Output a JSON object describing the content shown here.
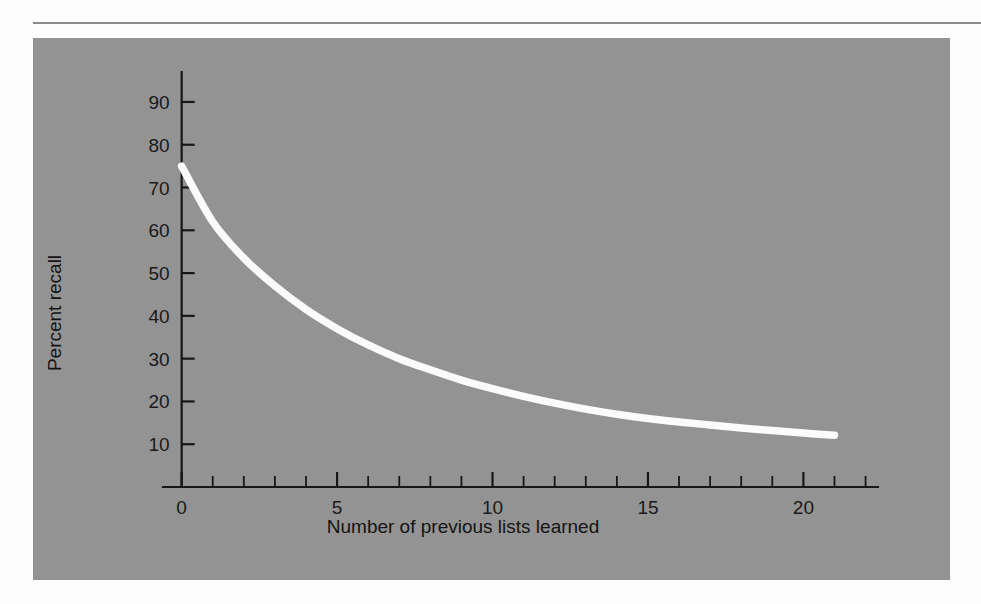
{
  "figure": {
    "background_color": "#fdfdfd",
    "panel_color": "#939393",
    "rule_color": "#8b8b8b",
    "curve_color": "#fbfbfb",
    "axis_color": "#171717"
  },
  "chart_data": {
    "type": "line",
    "title": "",
    "xlabel": "Number of previous lists learned",
    "ylabel": "Percent recall",
    "xlim": [
      -0.6,
      22.4
    ],
    "ylim": [
      0,
      97
    ],
    "grid": false,
    "legend": null,
    "x_ticks_major": [
      0,
      5,
      10,
      15,
      20
    ],
    "x_tick_labels": [
      "0",
      "5",
      "10",
      "15",
      "20"
    ],
    "x_ticks_minor_step": 1,
    "y_ticks_major": [
      10,
      20,
      30,
      40,
      50,
      60,
      70,
      80,
      90
    ],
    "y_tick_labels": [
      "10",
      "20",
      "30",
      "40",
      "50",
      "60",
      "70",
      "80",
      "90"
    ],
    "series": [
      {
        "name": "Percent recall",
        "color": "#fbfbfb",
        "x": [
          0,
          1,
          2,
          3,
          4,
          5,
          6,
          7,
          8,
          9,
          10,
          11,
          12,
          13,
          14,
          15,
          16,
          17,
          18,
          19,
          20,
          21
        ],
        "y": [
          75.0,
          62.0,
          53.5,
          47.0,
          41.5,
          37.0,
          33.2,
          30.0,
          27.4,
          25.0,
          23.0,
          21.2,
          19.6,
          18.2,
          17.0,
          16.0,
          15.2,
          14.5,
          13.8,
          13.2,
          12.6,
          12.1
        ]
      }
    ]
  }
}
